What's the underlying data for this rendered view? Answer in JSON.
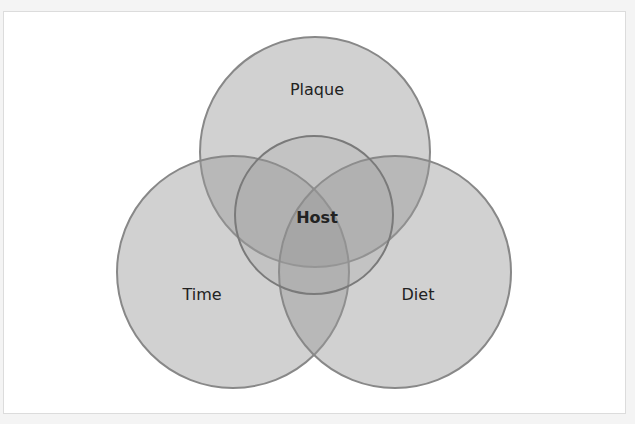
{
  "diagram": {
    "type": "venn",
    "sets": [
      {
        "id": "plaque",
        "label": "Plaque",
        "cx": 315,
        "cy": 152,
        "r": 115
      },
      {
        "id": "time",
        "label": "Time",
        "cx": 233,
        "cy": 272,
        "r": 116
      },
      {
        "id": "diet",
        "label": "Diet",
        "cx": 395,
        "cy": 272,
        "r": 116
      },
      {
        "id": "host",
        "label": "Host",
        "cx": 314,
        "cy": 215,
        "r": 79
      }
    ],
    "colors": {
      "fill": "#9a9a9a",
      "stroke": "#888888",
      "host_stroke": "#7a7a7a",
      "text": "#222222"
    }
  }
}
